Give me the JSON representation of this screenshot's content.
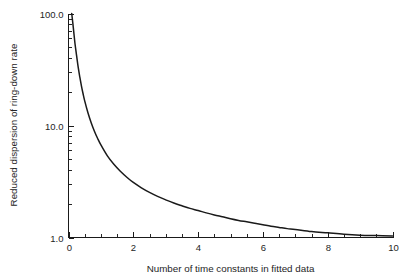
{
  "chart_data": {
    "type": "line",
    "title": "",
    "subtitle": "",
    "xlabel": "Number of time constants in fitted data",
    "ylabel": "Reduced dispersion of ring-down rate",
    "xlim": [
      0,
      10
    ],
    "ylim": [
      1.0,
      100.0
    ],
    "yscale": "log",
    "xscale": "linear",
    "grid": false,
    "legend": null,
    "legend_position": "none",
    "x_major_ticks": [
      0,
      2,
      4,
      6,
      8,
      10
    ],
    "x_major_tick_labels": [
      "0",
      "2",
      "4",
      "6",
      "8",
      "10"
    ],
    "x_minor_tick_step": 0.5,
    "y_major_ticks": [
      1.0,
      10.0,
      100.0
    ],
    "y_major_tick_labels": [
      "1.0",
      "10.0",
      "100.0"
    ],
    "y_minor_ticks": [
      2,
      3,
      4,
      5,
      6,
      7,
      8,
      9,
      20,
      30,
      40,
      50,
      60,
      70,
      80,
      90
    ],
    "series": [
      {
        "name": "Reduced dispersion",
        "x": [
          0.1,
          0.15,
          0.2,
          0.25,
          0.3,
          0.35,
          0.4,
          0.45,
          0.5,
          0.6,
          0.7,
          0.8,
          0.9,
          1.0,
          1.2,
          1.4,
          1.6,
          1.8,
          2.0,
          2.25,
          2.5,
          2.75,
          3.0,
          3.25,
          3.5,
          3.75,
          4.0,
          4.25,
          4.5,
          4.75,
          5.0,
          5.25,
          5.5,
          5.75,
          6.0,
          6.25,
          6.5,
          6.75,
          7.0,
          7.5,
          8.0,
          8.5,
          9.0,
          9.5,
          10.0
        ],
        "y": [
          100.0,
          74.0,
          54.0,
          42.0,
          33.0,
          27.0,
          22.5,
          19.2,
          16.6,
          13.0,
          10.6,
          8.9,
          7.65,
          6.7,
          5.35,
          4.5,
          3.9,
          3.45,
          3.1,
          2.78,
          2.53,
          2.33,
          2.17,
          2.03,
          1.92,
          1.82,
          1.74,
          1.66,
          1.59,
          1.53,
          1.47,
          1.42,
          1.38,
          1.34,
          1.3,
          1.26,
          1.23,
          1.2,
          1.18,
          1.13,
          1.1,
          1.07,
          1.05,
          1.04,
          1.03
        ],
        "color": "#1a1a1a",
        "style": "solid"
      }
    ],
    "annotations": []
  },
  "figure": {
    "background_color": "#ffffff",
    "axis_color": "#1a1a1a",
    "text_color": "#252525"
  }
}
